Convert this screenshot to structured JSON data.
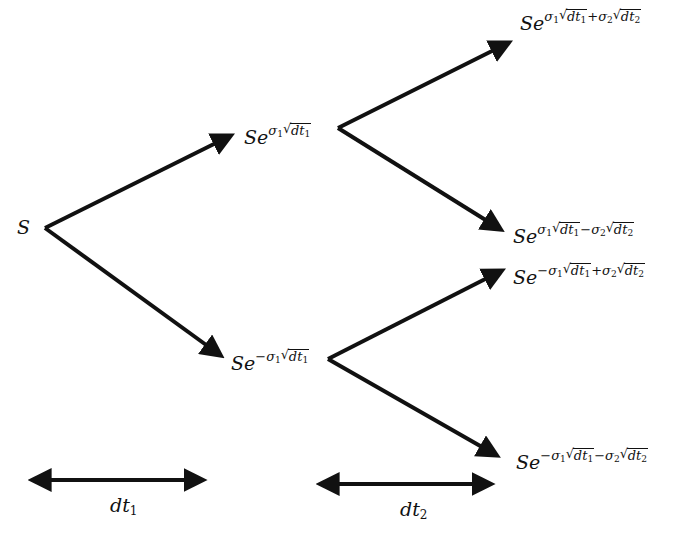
{
  "diagram": {
    "type": "binomial-tree",
    "title": "",
    "nodes": {
      "root": {
        "label": "S",
        "base": "S"
      },
      "up": {
        "label": "Se^{σ1√dt1}",
        "base": "Se",
        "sign1": "",
        "sigma1": "σ",
        "sub1": "1",
        "dt1": "dt",
        "dtsub1": "1"
      },
      "down": {
        "label": "Se^{-σ1√dt1}",
        "base": "Se",
        "sign1": "−",
        "sigma1": "σ",
        "sub1": "1",
        "dt1": "dt",
        "dtsub1": "1"
      },
      "up_up": {
        "label": "Se^{σ1√dt1+σ2√dt2}",
        "base": "Se",
        "sign1": "",
        "sigma1": "σ",
        "sub1": "1",
        "dt1": "dt",
        "dtsub1": "1",
        "op": "+",
        "sigma2": "σ",
        "sub2": "2",
        "dt2": "dt",
        "dtsub2": "2"
      },
      "up_down": {
        "label": "Se^{σ1√dt1−σ2√dt2}",
        "base": "Se",
        "sign1": "",
        "sigma1": "σ",
        "sub1": "1",
        "dt1": "dt",
        "dtsub1": "1",
        "op": "−",
        "sigma2": "σ",
        "sub2": "2",
        "dt2": "dt",
        "dtsub2": "2"
      },
      "down_up": {
        "label": "Se^{−σ1√dt1+σ2√dt2}",
        "base": "Se",
        "sign1": "−",
        "sigma1": "σ",
        "sub1": "1",
        "dt1": "dt",
        "dtsub1": "1",
        "op": "+",
        "sigma2": "σ",
        "sub2": "2",
        "dt2": "dt",
        "dtsub2": "2"
      },
      "down_down": {
        "label": "Se^{−σ1√dt1−σ2√dt2}",
        "base": "Se",
        "sign1": "−",
        "sigma1": "σ",
        "sub1": "1",
        "dt1": "dt",
        "dtsub1": "1",
        "op": "−",
        "sigma2": "σ",
        "sub2": "2",
        "dt2": "dt",
        "dtsub2": "2"
      }
    },
    "edges": [
      {
        "from": "root",
        "to": "up"
      },
      {
        "from": "root",
        "to": "down"
      },
      {
        "from": "up",
        "to": "up_up"
      },
      {
        "from": "up",
        "to": "up_down"
      },
      {
        "from": "down",
        "to": "down_up"
      },
      {
        "from": "down",
        "to": "down_down"
      }
    ],
    "intervals": [
      {
        "label": "dt",
        "sub": "1"
      },
      {
        "label": "dt",
        "sub": "2"
      }
    ],
    "colors": {
      "stroke": "#111111",
      "background": "#ffffff"
    }
  }
}
